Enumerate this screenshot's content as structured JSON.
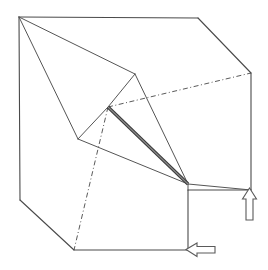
{
  "figure": {
    "stroke_color": "#4a4a4a",
    "accent_color": "#3a3a3a",
    "background_color": "#ffffff",
    "canvas": {
      "width": 268,
      "height": 270
    },
    "outer_body": {
      "name": "cube-outline",
      "points": "19,17 198,18 251,73 251,190 188,190 188,250 74,250 20,200"
    },
    "edges": [
      {
        "name": "cube-top-back-edge",
        "points": "19,17 198,18"
      },
      {
        "name": "cube-top-right-edge",
        "points": "198,18 251,73"
      },
      {
        "name": "cube-right-vertical-edge",
        "points": "251,73 251,190"
      },
      {
        "name": "cube-lower-right-step-edge",
        "points": "251,190 188,190"
      },
      {
        "name": "cube-step-vertical-edge",
        "points": "188,190 188,250"
      },
      {
        "name": "cube-bottom-edge",
        "points": "74,250 188,250"
      },
      {
        "name": "cube-lower-left-bevel-edge",
        "points": "20,200 74,250"
      },
      {
        "name": "cube-left-vertical-edge",
        "points": "19,17 20,200"
      },
      {
        "name": "wedge-ridge-top-left",
        "points": "19,17 135,74"
      },
      {
        "name": "wedge-ridge-left-lower",
        "points": "19,17 78,139"
      },
      {
        "name": "wedge-apex-to-node",
        "points": "135,74 108,107"
      },
      {
        "name": "wedge-apex-to-corner",
        "points": "135,74 188,184"
      },
      {
        "name": "wedge-node-to-left-vertex",
        "points": "108,107 78,139"
      },
      {
        "name": "wedge-left-vertex-to-corner",
        "points": "78,139 188,184"
      },
      {
        "name": "wedge-corner-to-right-face",
        "points": "188,184 251,190"
      },
      {
        "name": "wedge-corner-vertical-drop",
        "points": "188,184 188,190"
      }
    ],
    "thick_edge": {
      "name": "cut-plane-edge",
      "points": "108,107 188,184"
    },
    "hidden_edges": [
      {
        "name": "hidden-diagonal-to-right-corner",
        "points": "108,107 251,73"
      },
      {
        "name": "hidden-diagonal-to-bottom-corner",
        "points": "108,107 74,250"
      }
    ],
    "vertices": [
      {
        "name": "vertex-top-left",
        "x": 19,
        "y": 17
      },
      {
        "name": "vertex-top-right",
        "x": 198,
        "y": 18
      },
      {
        "name": "vertex-right-upper",
        "x": 251,
        "y": 73
      },
      {
        "name": "vertex-right-lower",
        "x": 251,
        "y": 190
      },
      {
        "name": "vertex-step-inner",
        "x": 188,
        "y": 190
      },
      {
        "name": "vertex-step-bottom",
        "x": 188,
        "y": 250
      },
      {
        "name": "vertex-bottom-left",
        "x": 74,
        "y": 250
      },
      {
        "name": "vertex-left-lower",
        "x": 20,
        "y": 200
      },
      {
        "name": "vertex-wedge-apex",
        "x": 135,
        "y": 74
      },
      {
        "name": "vertex-wedge-node",
        "x": 108,
        "y": 107
      },
      {
        "name": "vertex-wedge-left",
        "x": 78,
        "y": 139
      },
      {
        "name": "vertex-wedge-corner",
        "x": 188,
        "y": 184
      }
    ],
    "arrows": [
      {
        "name": "up-arrow",
        "direction": "up",
        "label": "",
        "points": "249.5,188 256.5,199 253,199 253,220 246,220 246,199 242.5,199"
      },
      {
        "name": "left-arrow",
        "direction": "left",
        "label": "",
        "points": "186,249.5 197,243 197,246.5 215,246.5 215,253 197,253 197,256.5"
      }
    ]
  }
}
